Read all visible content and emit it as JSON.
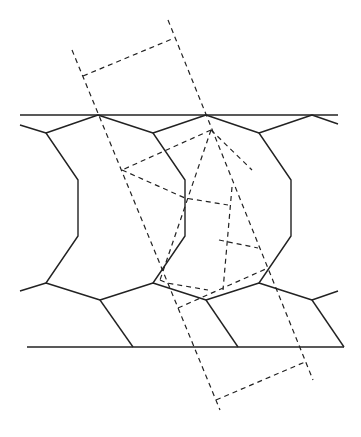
{
  "diagram": {
    "width": 361,
    "height": 437,
    "background": "#ffffff",
    "stroke_color": "#222222",
    "solid_width": 1.4,
    "dashed_width": 1.2,
    "dash_pattern": "5,4",
    "solid_paths": [
      "M20,115 L338,115",
      "M27,347 L344,347",
      "M20,125 L46,133 L98,115 L153,133 L206,115 L259,133 L312,115 L338,124",
      "M20,291 L46,283 L100,300 L153,283 L206,300 L259,283 L312,300 L338,291",
      "M46,133 L78,180 L78,236 L46,283",
      "M153,133 L185,180 L185,236 L153,283",
      "M259,133 L291,180 L291,236 L259,283",
      "M100,300 L133,347",
      "M206,300 L238,347",
      "M312,300 L344,347"
    ],
    "dashed_paths": [
      "M72,50 L220,410",
      "M168,20 L313,380",
      "M83,76 L172,39",
      "M216,400 L305,362",
      "M211,130 L122,170",
      "M122,170 L185,198 L228,205",
      "M211,130 L160,280",
      "M160,280 L167,283 L208,290",
      "M211,130 L252,170",
      "M232,187 L223,290",
      "M219,240 L258,248",
      "M178,308 L268,268"
    ]
  }
}
